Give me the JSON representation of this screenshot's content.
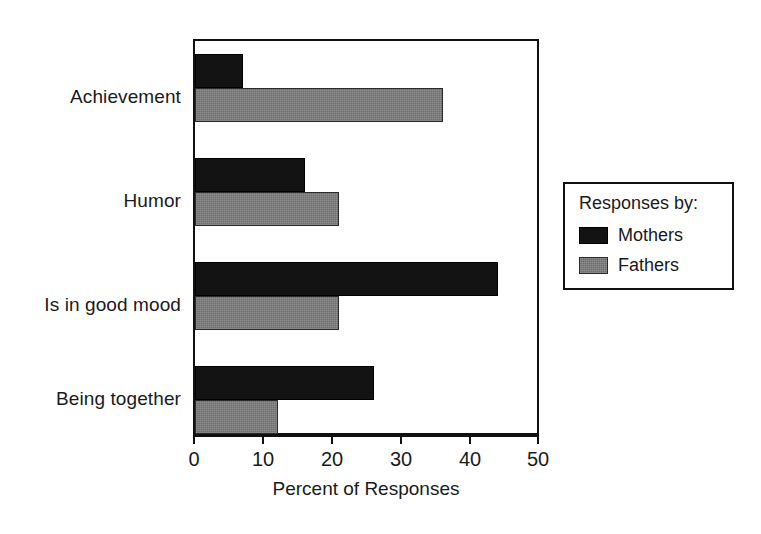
{
  "chart_data": {
    "type": "bar",
    "orientation": "horizontal",
    "title": "",
    "subtitle": "",
    "xlabel": "Percent of Responses",
    "ylabel": "",
    "categories": [
      "Achievement",
      "Humor",
      "Is in good mood",
      "Being together"
    ],
    "series": [
      {
        "name": "Mothers",
        "color": "#131313",
        "values": [
          7,
          16,
          44,
          26
        ]
      },
      {
        "name": "Fathers",
        "color": "#6e6e6e",
        "values": [
          36,
          21,
          21,
          12
        ]
      }
    ],
    "xlim": [
      0,
      50
    ],
    "xticks": [
      0,
      10,
      20,
      30,
      40,
      50
    ],
    "xticklabels": [
      "0",
      "10",
      "20",
      "30",
      "40",
      "50"
    ],
    "grid": false,
    "legend": {
      "position": "right",
      "title": "Responses by:",
      "entries": [
        {
          "label": "Mothers",
          "swatch": "mothers"
        },
        {
          "label": "Fathers",
          "swatch": "fathers"
        }
      ]
    }
  },
  "colors": {
    "mothers": "#131313",
    "fathers": "#6e6e6e",
    "axis": "#111111",
    "text": "#1a1a1a",
    "background": "#ffffff"
  }
}
